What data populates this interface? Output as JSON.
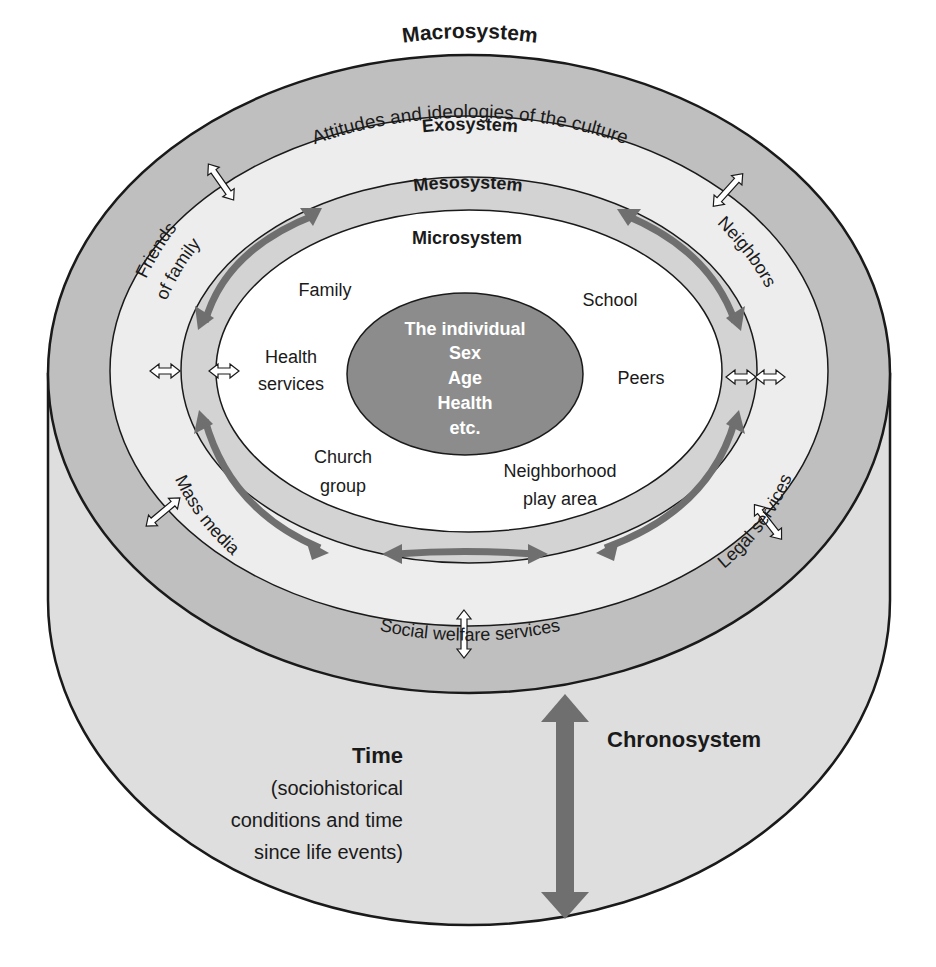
{
  "diagram": {
    "colors": {
      "macro_ring": "#bfbfbf",
      "exo_ring": "#ededed",
      "meso_ring": "#d3d3d3",
      "micro_area": "#ffffff",
      "individual": "#8c8c8c",
      "cylinder_wall": "#dedede",
      "arrow": "#6f6f6f",
      "outline": "#1a1a1a"
    },
    "macrosystem": {
      "title": "Macrosystem",
      "subtitle": "Attitudes and ideologies of the culture"
    },
    "exosystem": {
      "title": "Exosystem",
      "items": {
        "friends_line1": "Friends",
        "friends_line2": "of family",
        "neighbors": "Neighbors",
        "mass_media": "Mass media",
        "legal_services": "Legal services",
        "social_welfare": "Social welfare services"
      }
    },
    "mesosystem": {
      "title": "Mesosystem"
    },
    "microsystem": {
      "title": "Microsystem",
      "items": {
        "family": "Family",
        "school": "School",
        "health_line1": "Health",
        "health_line2": "services",
        "peers": "Peers",
        "church_line1": "Church",
        "church_line2": "group",
        "neighborhood_line1": "Neighborhood",
        "neighborhood_line2": "play area"
      }
    },
    "individual": {
      "lines": [
        "The individual",
        "Sex",
        "Age",
        "Health",
        "etc."
      ]
    },
    "chronosystem": {
      "title": "Chronosystem",
      "time_title": "Time",
      "time_lines": [
        "(sociohistorical",
        "conditions and time",
        "since life events)"
      ]
    }
  }
}
